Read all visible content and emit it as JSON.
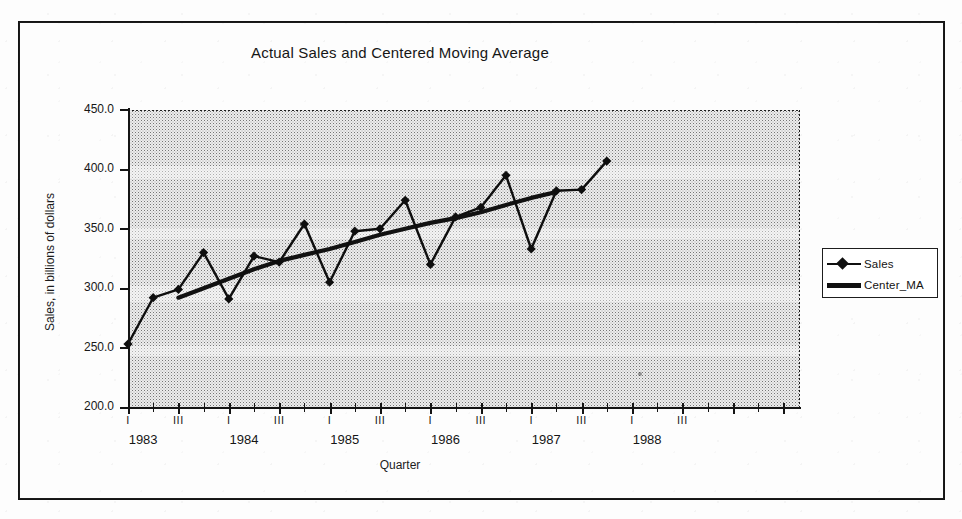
{
  "figure": {
    "title": "Actual Sales and Centered Moving Average",
    "xlabel": "Quarter",
    "ylabel": "Sales, in billions of dollars"
  },
  "legend": {
    "items": [
      {
        "label": "Sales",
        "key": "diamond-line"
      },
      {
        "label": "Center_MA",
        "key": "thick-line"
      }
    ]
  },
  "axes": {
    "y_ticks": [
      "450.0",
      "400.0",
      "350.0",
      "300.0",
      "250.0",
      "200.0"
    ],
    "quarter_labels": [
      "I",
      "III",
      "I",
      "III",
      "I",
      "III",
      "I",
      "III",
      "I",
      "III",
      "I",
      "III"
    ],
    "year_labels": [
      "1983",
      "1984",
      "1985",
      "1986",
      "1987",
      "1988"
    ]
  },
  "chart_data": {
    "type": "line",
    "title": "Actual Sales and Centered Moving Average",
    "xlabel": "Quarter",
    "ylabel": "Sales, in billions of dollars",
    "ylim": [
      200.0,
      450.0
    ],
    "ytick_step": 50.0,
    "grid": false,
    "legend_position": "right-outside",
    "x": [
      "1983 I",
      "1983 II",
      "1983 III",
      "1983 IV",
      "1984 I",
      "1984 II",
      "1984 III",
      "1984 IV",
      "1985 I",
      "1985 II",
      "1985 III",
      "1985 IV",
      "1986 I",
      "1986 II",
      "1986 III",
      "1986 IV",
      "1987 I",
      "1987 II",
      "1987 III",
      "1987 IV"
    ],
    "series": [
      {
        "name": "Sales",
        "marker": "diamond",
        "values": [
          253,
          292,
          299,
          330,
          291,
          327,
          322,
          354,
          305,
          348,
          350,
          374,
          320,
          360,
          368,
          395,
          333,
          382,
          383,
          407
        ]
      },
      {
        "name": "Center_MA",
        "marker": "none",
        "values": [
          null,
          null,
          292,
          300,
          308,
          316,
          323,
          328,
          333,
          339,
          345,
          350,
          355,
          359,
          364,
          370,
          376,
          381,
          null,
          null
        ]
      }
    ]
  }
}
